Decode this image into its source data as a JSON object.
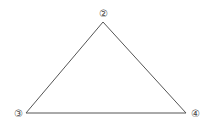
{
  "diagram": {
    "type": "triangle",
    "stroke_color": "#555555",
    "vertices": [
      {
        "id": "top",
        "label": "②",
        "x": 103,
        "y": 22,
        "label_x": 103,
        "label_y": 17
      },
      {
        "id": "left",
        "label": "③",
        "x": 26,
        "y": 113,
        "label_x": 18,
        "label_y": 117
      },
      {
        "id": "right",
        "label": "④",
        "x": 186,
        "y": 113,
        "label_x": 195,
        "label_y": 117
      }
    ],
    "edges": [
      {
        "from": "top",
        "to": "left"
      },
      {
        "from": "top",
        "to": "right"
      },
      {
        "from": "left",
        "to": "right"
      }
    ]
  }
}
